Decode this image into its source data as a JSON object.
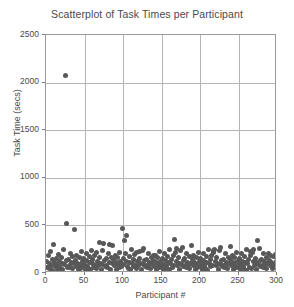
{
  "chart_data": {
    "type": "scatter",
    "title": "Scatterplot of Task Times per Participant",
    "xlabel": "Participant #",
    "ylabel": "Task Time (secs)",
    "xlim": [
      0,
      300
    ],
    "ylim": [
      0,
      2500
    ],
    "xticks": [
      0,
      50,
      100,
      150,
      200,
      250,
      300
    ],
    "yticks": [
      0,
      500,
      1000,
      1500,
      2000,
      2500
    ],
    "grid": true,
    "legend": "none",
    "marker_color": "#585858",
    "marker_size_px": 5,
    "series": [
      {
        "name": "Task Time",
        "points": [
          [
            1,
            120
          ],
          [
            2,
            60
          ],
          [
            3,
            180
          ],
          [
            4,
            95
          ],
          [
            5,
            45
          ],
          [
            6,
            230
          ],
          [
            7,
            75
          ],
          [
            8,
            140
          ],
          [
            9,
            30
          ],
          [
            10,
            300
          ],
          [
            11,
            110
          ],
          [
            12,
            65
          ],
          [
            13,
            155
          ],
          [
            14,
            85
          ],
          [
            15,
            40
          ],
          [
            16,
            195
          ],
          [
            17,
            125
          ],
          [
            18,
            70
          ],
          [
            19,
            50
          ],
          [
            20,
            165
          ],
          [
            21,
            100
          ],
          [
            22,
            35
          ],
          [
            23,
            250
          ],
          [
            24,
            90
          ],
          [
            25,
            2070
          ],
          [
            26,
            130
          ],
          [
            27,
            520
          ],
          [
            28,
            60
          ],
          [
            29,
            145
          ],
          [
            30,
            80
          ],
          [
            31,
            55
          ],
          [
            32,
            210
          ],
          [
            33,
            115
          ],
          [
            34,
            45
          ],
          [
            35,
            170
          ],
          [
            36,
            95
          ],
          [
            37,
            460
          ],
          [
            38,
            135
          ],
          [
            39,
            70
          ],
          [
            40,
            185
          ],
          [
            41,
            105
          ],
          [
            42,
            40
          ],
          [
            43,
            160
          ],
          [
            44,
            88
          ],
          [
            45,
            52
          ],
          [
            46,
            225
          ],
          [
            47,
            118
          ],
          [
            48,
            68
          ],
          [
            49,
            150
          ],
          [
            50,
            92
          ],
          [
            51,
            38
          ],
          [
            52,
            205
          ],
          [
            53,
            128
          ],
          [
            54,
            72
          ],
          [
            55,
            48
          ],
          [
            56,
            175
          ],
          [
            57,
            108
          ],
          [
            58,
            33
          ],
          [
            59,
            240
          ],
          [
            60,
            98
          ],
          [
            61,
            142
          ],
          [
            62,
            62
          ],
          [
            63,
            188
          ],
          [
            64,
            82
          ],
          [
            65,
            44
          ],
          [
            66,
            215
          ],
          [
            67,
            122
          ],
          [
            68,
            76
          ],
          [
            69,
            320
          ],
          [
            70,
            158
          ],
          [
            71,
            102
          ],
          [
            72,
            36
          ],
          [
            73,
            235
          ],
          [
            74,
            86
          ],
          [
            75,
            310
          ],
          [
            76,
            132
          ],
          [
            77,
            66
          ],
          [
            78,
            148
          ],
          [
            79,
            78
          ],
          [
            80,
            54
          ],
          [
            81,
            200
          ],
          [
            82,
            112
          ],
          [
            83,
            300
          ],
          [
            84,
            42
          ],
          [
            85,
            168
          ],
          [
            86,
            96
          ],
          [
            87,
            290
          ],
          [
            88,
            138
          ],
          [
            89,
            74
          ],
          [
            90,
            182
          ],
          [
            91,
            106
          ],
          [
            92,
            41
          ],
          [
            93,
            162
          ],
          [
            94,
            89
          ],
          [
            95,
            56
          ],
          [
            96,
            220
          ],
          [
            97,
            116
          ],
          [
            98,
            69
          ],
          [
            99,
            470
          ],
          [
            100,
            152
          ],
          [
            101,
            94
          ],
          [
            102,
            340
          ],
          [
            103,
            208
          ],
          [
            104,
            126
          ],
          [
            105,
            395
          ],
          [
            106,
            71
          ],
          [
            107,
            49
          ],
          [
            108,
            178
          ],
          [
            109,
            109
          ],
          [
            110,
            34
          ],
          [
            111,
            245
          ],
          [
            112,
            99
          ],
          [
            113,
            144
          ],
          [
            114,
            64
          ],
          [
            115,
            190
          ],
          [
            116,
            84
          ],
          [
            117,
            46
          ],
          [
            118,
            218
          ],
          [
            119,
            124
          ],
          [
            120,
            77
          ],
          [
            121,
            230
          ],
          [
            122,
            156
          ],
          [
            123,
            104
          ],
          [
            124,
            37
          ],
          [
            125,
            238
          ],
          [
            126,
            87
          ],
          [
            127,
            260
          ],
          [
            128,
            134
          ],
          [
            129,
            67
          ],
          [
            130,
            146
          ],
          [
            131,
            79
          ],
          [
            132,
            57
          ],
          [
            133,
            202
          ],
          [
            134,
            114
          ],
          [
            135,
            91
          ],
          [
            136,
            43
          ],
          [
            137,
            166
          ],
          [
            138,
            97
          ],
          [
            139,
            180
          ],
          [
            140,
            136
          ],
          [
            141,
            73
          ],
          [
            142,
            184
          ],
          [
            143,
            107
          ],
          [
            144,
            39
          ],
          [
            145,
            164
          ],
          [
            146,
            90
          ],
          [
            147,
            58
          ],
          [
            148,
            222
          ],
          [
            149,
            117
          ],
          [
            150,
            70
          ],
          [
            151,
            154
          ],
          [
            152,
            93
          ],
          [
            153,
            35
          ],
          [
            154,
            206
          ],
          [
            155,
            129
          ],
          [
            156,
            75
          ],
          [
            157,
            47
          ],
          [
            158,
            176
          ],
          [
            159,
            110
          ],
          [
            160,
            32
          ],
          [
            161,
            242
          ],
          [
            162,
            100
          ],
          [
            163,
            141
          ],
          [
            164,
            63
          ],
          [
            165,
            186
          ],
          [
            166,
            83
          ],
          [
            167,
            350
          ],
          [
            168,
            216
          ],
          [
            169,
            255
          ],
          [
            170,
            123
          ],
          [
            171,
            78
          ],
          [
            172,
            160
          ],
          [
            173,
            103
          ],
          [
            174,
            38
          ],
          [
            175,
            236
          ],
          [
            176,
            88
          ],
          [
            177,
            265
          ],
          [
            178,
            131
          ],
          [
            179,
            68
          ],
          [
            180,
            149
          ],
          [
            181,
            80
          ],
          [
            182,
            55
          ],
          [
            183,
            204
          ],
          [
            184,
            113
          ],
          [
            185,
            92
          ],
          [
            186,
            44
          ],
          [
            187,
            169
          ],
          [
            188,
            98
          ],
          [
            189,
            285
          ],
          [
            190,
            139
          ],
          [
            191,
            76
          ],
          [
            192,
            183
          ],
          [
            193,
            111
          ],
          [
            194,
            42
          ],
          [
            195,
            161
          ],
          [
            196,
            85
          ],
          [
            197,
            59
          ],
          [
            198,
            219
          ],
          [
            199,
            119
          ],
          [
            200,
            72
          ],
          [
            201,
            153
          ],
          [
            202,
            95
          ],
          [
            203,
            36
          ],
          [
            204,
            207
          ],
          [
            205,
            127
          ],
          [
            206,
            74
          ],
          [
            207,
            50
          ],
          [
            208,
            177
          ],
          [
            209,
            108
          ],
          [
            210,
            31
          ],
          [
            211,
            244
          ],
          [
            212,
            101
          ],
          [
            213,
            143
          ],
          [
            214,
            65
          ],
          [
            215,
            189
          ],
          [
            216,
            81
          ],
          [
            217,
            240
          ],
          [
            218,
            214
          ],
          [
            219,
            250
          ],
          [
            220,
            121
          ],
          [
            221,
            79
          ],
          [
            222,
            159
          ],
          [
            223,
            105
          ],
          [
            224,
            40
          ],
          [
            225,
            234
          ],
          [
            226,
            86
          ],
          [
            227,
            270
          ],
          [
            228,
            133
          ],
          [
            229,
            66
          ],
          [
            230,
            147
          ],
          [
            231,
            82
          ],
          [
            232,
            53
          ],
          [
            233,
            203
          ],
          [
            234,
            115
          ],
          [
            235,
            93
          ],
          [
            236,
            45
          ],
          [
            237,
            167
          ],
          [
            238,
            99
          ],
          [
            239,
            275
          ],
          [
            240,
            137
          ],
          [
            241,
            77
          ],
          [
            242,
            181
          ],
          [
            243,
            112
          ],
          [
            244,
            41
          ],
          [
            245,
            163
          ],
          [
            246,
            84
          ],
          [
            247,
            60
          ],
          [
            248,
            217
          ],
          [
            249,
            120
          ],
          [
            250,
            71
          ],
          [
            251,
            151
          ],
          [
            252,
            96
          ],
          [
            253,
            34
          ],
          [
            254,
            209
          ],
          [
            255,
            125
          ],
          [
            256,
            73
          ],
          [
            257,
            51
          ],
          [
            258,
            174
          ],
          [
            259,
            109
          ],
          [
            260,
            30
          ],
          [
            261,
            246
          ],
          [
            262,
            102
          ],
          [
            263,
            140
          ],
          [
            264,
            61
          ],
          [
            265,
            187
          ],
          [
            266,
            224
          ],
          [
            267,
            46
          ],
          [
            268,
            212
          ],
          [
            269,
            252
          ],
          [
            270,
            118
          ],
          [
            271,
            80
          ],
          [
            272,
            157
          ],
          [
            273,
            106
          ],
          [
            274,
            39
          ],
          [
            275,
            345
          ],
          [
            276,
            89
          ],
          [
            277,
            258
          ],
          [
            278,
            130
          ],
          [
            279,
            69
          ],
          [
            280,
            145
          ],
          [
            281,
            83
          ],
          [
            282,
            56
          ],
          [
            283,
            201
          ],
          [
            284,
            116
          ],
          [
            285,
            94
          ],
          [
            286,
            47
          ],
          [
            287,
            165
          ],
          [
            288,
            97
          ],
          [
            289,
            210
          ],
          [
            290,
            135
          ],
          [
            291,
            75
          ],
          [
            292,
            179
          ],
          [
            293,
            114
          ],
          [
            294,
            43
          ],
          [
            295,
            172
          ],
          [
            296,
            87
          ],
          [
            297,
            62
          ],
          [
            298,
            198
          ],
          [
            299,
            122
          ],
          [
            300,
            64
          ]
        ]
      }
    ]
  }
}
